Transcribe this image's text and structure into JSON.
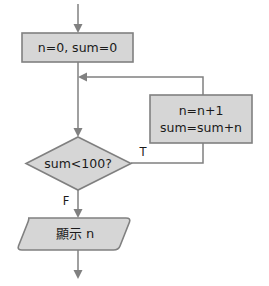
{
  "diagram": {
    "background_color": "#ffffff",
    "shape_fill": "#d6d6d6",
    "shape_stroke": "#808080",
    "connector_color": "#808080",
    "text_color": "#1a1a1a",
    "nodes": {
      "initialize": {
        "type": "process",
        "label": "n=0, sum=0"
      },
      "increment": {
        "type": "process",
        "line1": "n=n+1",
        "line2": "sum=sum+n"
      },
      "condition": {
        "type": "decision",
        "label": "sum<100?"
      },
      "output": {
        "type": "output",
        "label": "顯示 n"
      }
    },
    "branches": {
      "true_label": "T",
      "false_label": "F"
    }
  }
}
